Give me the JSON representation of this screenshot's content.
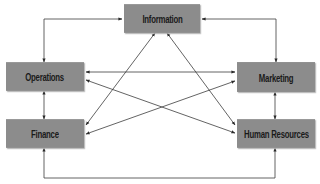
{
  "diagram": {
    "type": "organizational-flow",
    "colors": {
      "node_fill": "#8c8c8c",
      "node_text": "#1a1a1a",
      "connector": "#3c3c3c",
      "background": "#ffffff"
    },
    "nodes": {
      "information": {
        "label": "Information"
      },
      "operations": {
        "label": "Operations"
      },
      "marketing": {
        "label": "Marketing"
      },
      "finance": {
        "label": "Finance"
      },
      "human_resources": {
        "label": "Human Resources"
      }
    },
    "edges": [
      {
        "from": "Information",
        "to": "Operations",
        "direction": "bidirectional",
        "route": "elbow-top-left"
      },
      {
        "from": "Information",
        "to": "Marketing",
        "direction": "bidirectional",
        "route": "elbow-top-right"
      },
      {
        "from": "Information",
        "to": "Finance",
        "direction": "bidirectional",
        "route": "diagonal"
      },
      {
        "from": "Information",
        "to": "Human Resources",
        "direction": "bidirectional",
        "route": "diagonal"
      },
      {
        "from": "Operations",
        "to": "Marketing",
        "direction": "bidirectional",
        "route": "horizontal"
      },
      {
        "from": "Operations",
        "to": "Human Resources",
        "direction": "bidirectional",
        "route": "diagonal"
      },
      {
        "from": "Operations",
        "to": "Finance",
        "direction": "bidirectional",
        "route": "vertical"
      },
      {
        "from": "Marketing",
        "to": "Finance",
        "direction": "bidirectional",
        "route": "diagonal"
      },
      {
        "from": "Marketing",
        "to": "Human Resources",
        "direction": "bidirectional",
        "route": "vertical"
      },
      {
        "from": "Finance",
        "to": "Human Resources",
        "direction": "bidirectional",
        "route": "elbow-bottom"
      }
    ]
  }
}
